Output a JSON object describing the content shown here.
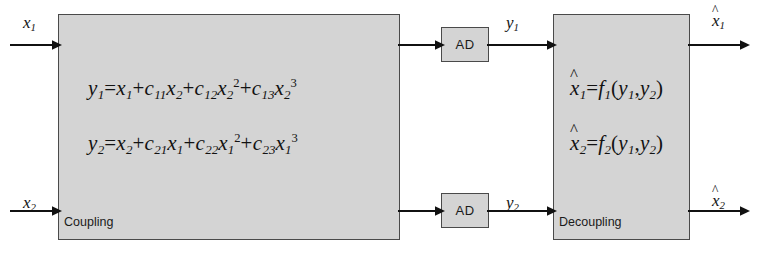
{
  "diagram": {
    "blocks": {
      "coupling": {
        "label": "Coupling",
        "equations": [
          {
            "id": "y1",
            "plain": "y1=x1+c11x2+c12x2^2+c13x2^3",
            "parts": [
              {
                "t": "y",
                "sub": "1"
              },
              {
                "op": "="
              },
              {
                "t": "x",
                "sub": "1"
              },
              {
                "op": "+"
              },
              {
                "t": "c",
                "sub": "11"
              },
              {
                "t": "x",
                "sub": "2"
              },
              {
                "op": "+"
              },
              {
                "t": "c",
                "sub": "12"
              },
              {
                "t": "x",
                "sub": "2",
                "sup": "2"
              },
              {
                "op": "+"
              },
              {
                "t": "c",
                "sub": "13"
              },
              {
                "t": "x",
                "sub": "2",
                "sup": "3"
              }
            ]
          },
          {
            "id": "y2",
            "plain": "y2=x2+c21x1+c22x1^2+c23x1^3",
            "parts": [
              {
                "t": "y",
                "sub": "2"
              },
              {
                "op": "="
              },
              {
                "t": "x",
                "sub": "2"
              },
              {
                "op": "+"
              },
              {
                "t": "c",
                "sub": "21"
              },
              {
                "t": "x",
                "sub": "1"
              },
              {
                "op": "+"
              },
              {
                "t": "c",
                "sub": "22"
              },
              {
                "t": "x",
                "sub": "1",
                "sup": "2"
              },
              {
                "op": "+"
              },
              {
                "t": "c",
                "sub": "23"
              },
              {
                "t": "x",
                "sub": "1",
                "sup": "3"
              }
            ]
          }
        ]
      },
      "decoupling": {
        "label": "Decoupling",
        "equations": [
          {
            "id": "xhat1",
            "plain": "x̂1=f1(y1,y2)",
            "parts": [
              {
                "t": "x",
                "sub": "1",
                "hat": true
              },
              {
                "op": "="
              },
              {
                "t": "f",
                "sub": "1"
              },
              {
                "op": "("
              },
              {
                "t": "y",
                "sub": "1"
              },
              {
                "op": ","
              },
              {
                "t": "y",
                "sub": "2"
              },
              {
                "op": ")"
              }
            ]
          },
          {
            "id": "xhat2",
            "plain": "x̂2=f2(y1,y2)",
            "parts": [
              {
                "t": "x",
                "sub": "2",
                "hat": true
              },
              {
                "op": "="
              },
              {
                "t": "f",
                "sub": "2"
              },
              {
                "op": "("
              },
              {
                "t": "y",
                "sub": "1"
              },
              {
                "op": ","
              },
              {
                "t": "y",
                "sub": "2"
              },
              {
                "op": ")"
              }
            ]
          }
        ]
      },
      "ad_top": {
        "label": "AD"
      },
      "ad_bottom": {
        "label": "AD"
      }
    },
    "signals": {
      "input_1": {
        "base": "x",
        "sub": "1",
        "hat": false
      },
      "input_2": {
        "base": "x",
        "sub": "2",
        "hat": false
      },
      "mid_1": {
        "base": "y",
        "sub": "1",
        "hat": false
      },
      "mid_2": {
        "base": "y",
        "sub": "2",
        "hat": false
      },
      "output_1": {
        "base": "x",
        "sub": "1",
        "hat": true
      },
      "output_2": {
        "base": "x",
        "sub": "2",
        "hat": true
      }
    },
    "colors": {
      "block_fill": "#d4d4d4",
      "block_border": "#4a4a4a",
      "line": "#111111",
      "background": "#ffffff",
      "text": "#121212"
    },
    "hat_glyph": "^"
  }
}
